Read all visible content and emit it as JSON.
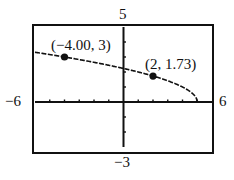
{
  "chart_data": {
    "type": "line",
    "title": "",
    "function": "y = sqrt(5 - x)",
    "xlabel": "",
    "ylabel": "",
    "xlim": [
      -6,
      6
    ],
    "ylim": [
      -3,
      5
    ],
    "xscale": 1,
    "yscale": 1,
    "grid": false,
    "window_labels": {
      "xmin": "−6",
      "xmax": "6",
      "ymin": "−3",
      "ymax": "5"
    },
    "series": [
      {
        "name": "y = sqrt(5 - x)",
        "x": [
          -6,
          -4,
          -2,
          0,
          2,
          4,
          4.5,
          5
        ],
        "y": [
          3.32,
          3,
          2.65,
          2.24,
          1.73,
          1,
          0.71,
          0
        ]
      }
    ],
    "points": [
      {
        "x": -4.0,
        "y": 3,
        "label": "(−4.00, 3)"
      },
      {
        "x": 2,
        "y": 1.73,
        "label": "(2, 1.73)"
      }
    ]
  }
}
